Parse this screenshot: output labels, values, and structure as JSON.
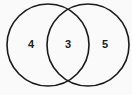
{
  "diagram": {
    "type": "venn",
    "sets": [
      {
        "name": "left-set",
        "only_count": "4"
      },
      {
        "name": "right-set",
        "only_count": "5"
      }
    ],
    "intersection_count": "3",
    "stroke_color": "#1a1a1a",
    "background": "#fafafa"
  }
}
